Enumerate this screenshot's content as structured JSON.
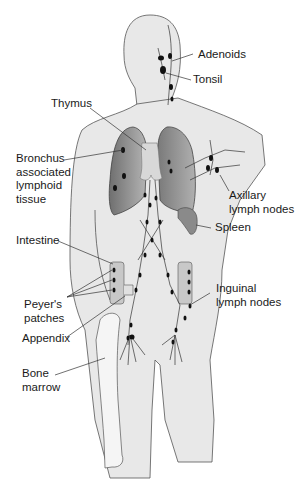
{
  "figure": {
    "colors": {
      "body_fill": "#e8e8e8",
      "outline": "#555555",
      "lung_dark": "#7a7a7a",
      "lung_light": "#a9a9a9",
      "thymus": "#d4d4d4",
      "node": "#111111",
      "spleen": "#8a8a8a",
      "bone": "#f4f4f4",
      "label_text": "#1a1a1a"
    },
    "labels": {
      "adenoids": "Adenoids",
      "tonsil": "Tonsil",
      "thymus": "Thymus",
      "balt": "Bronchus\nassociated\nlymphoid\ntissue",
      "axillary": "Axillary\nlymph nodes",
      "spleen": "Spleen",
      "intestine": "Intestine",
      "peyers": "Peyer's\npatches",
      "inguinal": "Inguinal\nlymph nodes",
      "appendix": "Appendix",
      "bone_marrow": "Bone\nmarrow"
    }
  }
}
